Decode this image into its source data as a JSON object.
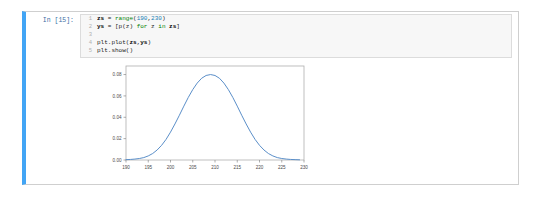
{
  "notebook": {
    "cell": {
      "prompt_label": "In [15]:",
      "selected": true,
      "accent_color": "#42a5f5",
      "code_lines": [
        {
          "number": "1",
          "text": "zs = range(190,230)"
        },
        {
          "number": "2",
          "text": "ys = [p(z) for z in zs]"
        },
        {
          "number": "3",
          "text": ""
        },
        {
          "number": "4",
          "text": "plt.plot(zs,ys)"
        },
        {
          "number": "5",
          "text": "plt.show()"
        }
      ]
    }
  },
  "chart_data": {
    "type": "line",
    "title": "",
    "xlabel": "",
    "ylabel": "",
    "xlim": [
      190,
      230
    ],
    "ylim": [
      0.0,
      0.088
    ],
    "grid": false,
    "legend": null,
    "line_color": "#5b8fc9",
    "xticks": [
      "190",
      "195",
      "200",
      "205",
      "210",
      "215",
      "220",
      "225",
      "230"
    ],
    "xtick_values": [
      190,
      195,
      200,
      205,
      210,
      215,
      220,
      225,
      230
    ],
    "yticks": [
      "0.00",
      "0.02",
      "0.04",
      "0.06",
      "0.08"
    ],
    "ytick_values": [
      0.0,
      0.02,
      0.04,
      0.06,
      0.08
    ],
    "series": [
      {
        "name": "ys",
        "x": [
          190,
          191,
          192,
          193,
          194,
          195,
          196,
          197,
          198,
          199,
          200,
          201,
          202,
          203,
          204,
          205,
          206,
          207,
          208,
          209,
          210,
          211,
          212,
          213,
          214,
          215,
          216,
          217,
          218,
          219,
          220,
          221,
          222,
          223,
          224,
          225,
          226,
          227,
          228,
          229
        ],
        "y": [
          0.0002,
          0.0003,
          0.0005,
          0.0008,
          0.0013,
          0.0022,
          0.0035,
          0.0054,
          0.0079,
          0.0111,
          0.015,
          0.0194,
          0.0241,
          0.029,
          0.0337,
          0.0379,
          0.0414,
          0.044,
          0.0455,
          0.046,
          0.0455,
          0.044,
          0.0414,
          0.0379,
          0.0337,
          0.029,
          0.0241,
          0.0194,
          0.015,
          0.0111,
          0.0079,
          0.0054,
          0.0035,
          0.0022,
          0.0013,
          0.0008,
          0.0005,
          0.0003,
          0.0002,
          0.0001
        ]
      }
    ],
    "peak": {
      "x": 210,
      "y": 0.08
    }
  }
}
